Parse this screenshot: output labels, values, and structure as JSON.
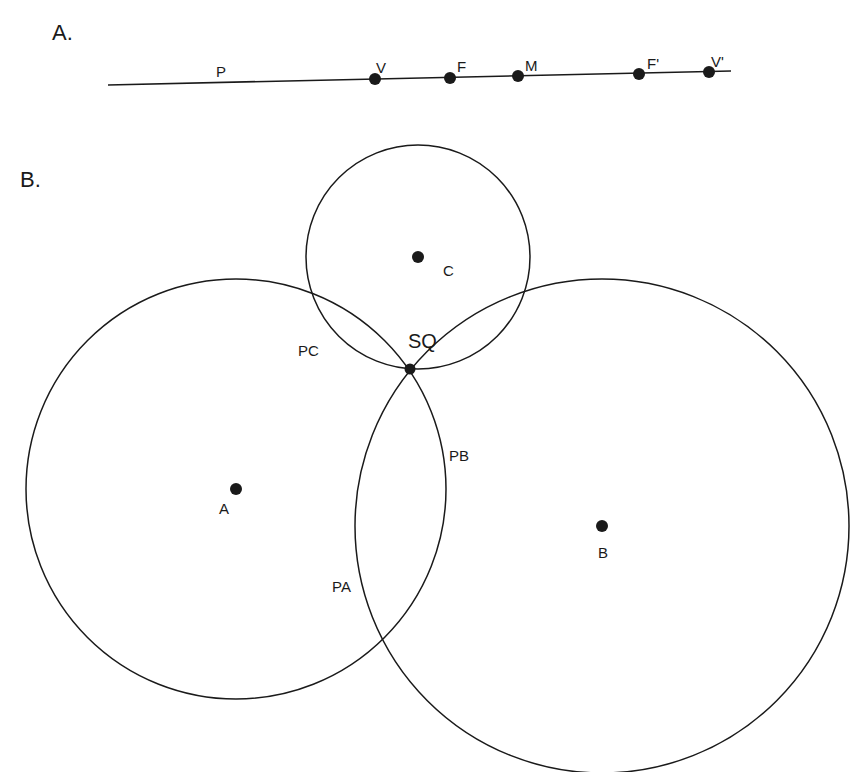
{
  "panel_a": {
    "label": "A.",
    "line": {
      "x1": 108,
      "y1": 85,
      "x2": 731,
      "y2": 71
    },
    "line_label": {
      "text": "P",
      "x": 216,
      "y": 77
    },
    "points": [
      {
        "name": "V",
        "cx": 375,
        "cy": 79,
        "lx": 376,
        "ly": 73
      },
      {
        "name": "F",
        "cx": 450,
        "cy": 78,
        "lx": 457,
        "ly": 72
      },
      {
        "name": "M",
        "cx": 518,
        "cy": 76,
        "lx": 525,
        "ly": 71
      },
      {
        "name": "F'",
        "cx": 639,
        "cy": 74,
        "lx": 647,
        "ly": 69
      },
      {
        "name": "V'",
        "cx": 709,
        "cy": 72,
        "lx": 711,
        "ly": 67
      }
    ]
  },
  "panel_b": {
    "label": "B.",
    "circles": [
      {
        "name": "C",
        "cx": 418,
        "cy": 257,
        "r": 112,
        "label": "C",
        "lx": 443,
        "ly": 276
      },
      {
        "name": "A",
        "cx": 236,
        "cy": 489,
        "r": 210,
        "label": "A",
        "lx": 219,
        "ly": 514
      },
      {
        "name": "B",
        "cx": 602,
        "cy": 526,
        "r": 247,
        "label": "B",
        "lx": 598,
        "ly": 558
      }
    ],
    "intersection": {
      "label": "SQ",
      "cx": 410,
      "cy": 369,
      "lx": 408,
      "ly": 348
    },
    "arc_labels": [
      {
        "text": "PC",
        "x": 298,
        "y": 356
      },
      {
        "text": "PB",
        "x": 449,
        "y": 461
      },
      {
        "text": "PA",
        "x": 332,
        "y": 592
      }
    ]
  }
}
